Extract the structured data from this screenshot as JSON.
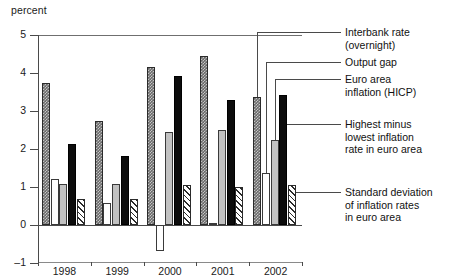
{
  "chart_data": {
    "type": "bar",
    "title": "",
    "subtitle": "",
    "xlabel": "",
    "ylabel": "percent",
    "ylim": [
      -1,
      5
    ],
    "yticks": [
      -1,
      0,
      1,
      2,
      3,
      4,
      5
    ],
    "ytick_labels": [
      "–1",
      "0",
      "1",
      "2",
      "3",
      "4",
      "5"
    ],
    "grid": false,
    "legend_position": "right",
    "categories": [
      "1998",
      "1999",
      "2000",
      "2001",
      "2002"
    ],
    "series": [
      {
        "name": "Interbank rate (overnight)",
        "key": "interbank",
        "fill": "dark-checkered",
        "values": [
          3.73,
          2.74,
          4.15,
          4.45,
          3.36
        ]
      },
      {
        "name": "Output gap",
        "key": "output_gap",
        "fill": "white-outline",
        "values": [
          1.22,
          0.58,
          -0.68,
          0.04,
          1.37
        ]
      },
      {
        "name": "Euro area inflation (HICP)",
        "key": "hicp",
        "fill": "light-grey",
        "values": [
          1.08,
          1.07,
          2.44,
          2.5,
          2.24
        ]
      },
      {
        "name": "Highest minus lowest inflation rate in euro area",
        "key": "spread",
        "fill": "solid-black",
        "values": [
          2.12,
          1.81,
          3.92,
          3.28,
          3.42
        ]
      },
      {
        "name": "Standard deviation of inflation rates in euro area",
        "key": "stdev",
        "fill": "diagonal-hatch",
        "values": [
          0.68,
          0.68,
          1.04,
          1.0,
          1.05
        ]
      }
    ]
  },
  "legend": {
    "items": [
      {
        "label": "Interbank rate\n(overnight)"
      },
      {
        "label": "Output gap"
      },
      {
        "label": "Euro area\ninflation (HICP)"
      },
      {
        "label": "Highest minus\nlowest inflation\nrate in euro area"
      },
      {
        "label": "Standard deviation\nof inflation rates\nin euro area"
      }
    ]
  },
  "colors": {
    "axis": "#4a4a4a",
    "frame": "#6f6f6f",
    "text": "#111111",
    "interbank": "#6a6a6a",
    "output_gap": "#ffffff",
    "hicp": "#c2c2c2",
    "spread": "#0c0c0c",
    "stdev": "#ffffff"
  }
}
